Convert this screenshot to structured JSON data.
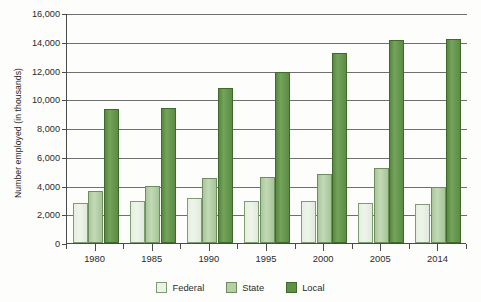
{
  "chart_data": {
    "type": "bar",
    "title": "",
    "xlabel": "",
    "ylabel": "Number employed (in thousands)",
    "categories": [
      "1980",
      "1985",
      "1990",
      "1995",
      "2000",
      "2005",
      "2014"
    ],
    "series": [
      {
        "name": "Federal",
        "color": "#ebf2e6",
        "values": [
          2800,
          2900,
          3100,
          2900,
          2900,
          2800,
          2700
        ]
      },
      {
        "name": "State",
        "color": "#b3d0a4",
        "values": [
          3600,
          4000,
          4500,
          4600,
          4800,
          5200,
          3900
        ]
      },
      {
        "name": "Local",
        "color": "#5f9145",
        "values": [
          9300,
          9400,
          10800,
          11900,
          13200,
          14100,
          14200
        ]
      }
    ],
    "ylim": [
      0,
      16000
    ],
    "ytick_values": [
      0,
      2000,
      4000,
      6000,
      8000,
      10000,
      12000,
      14000,
      16000
    ],
    "ytick_labels": [
      "0",
      "2,000",
      "4,000",
      "6,000",
      "8,000",
      "10,000",
      "12,000",
      "14,000",
      "16,000"
    ],
    "grid": true,
    "legend_position": "bottom"
  },
  "legend": {
    "items": [
      {
        "label": "Federal",
        "key": "federal"
      },
      {
        "label": "State",
        "key": "state"
      },
      {
        "label": "Local",
        "key": "local"
      }
    ]
  }
}
